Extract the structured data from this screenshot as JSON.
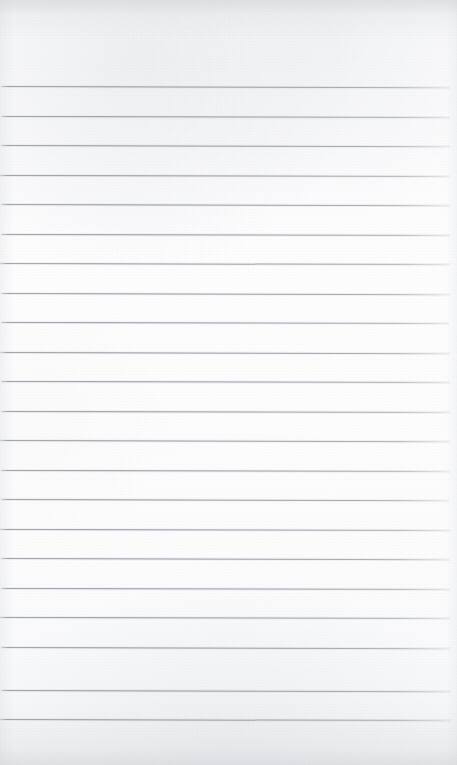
{
  "document": {
    "kind": "blank-ruled-notebook-paper",
    "title": "Blank Ruled Notebook Paper",
    "orientation": "portrait",
    "page_width_px": 457,
    "page_height_px": 765,
    "paper_color": "#fbfbfc",
    "paper_shadow_color": "#eef0f1",
    "has_text_content": false,
    "has_handwriting": false,
    "has_margin_rule": false,
    "body_text": ""
  },
  "ruling": {
    "style": "wide-ruled",
    "line_color": "#989ea7",
    "line_thickness_px": 1,
    "line_count": 22,
    "first_line_y": 86,
    "line_spacing_px": 29.45,
    "line_left_x": 1,
    "line_right_x": 450,
    "tilt_deg": 0.14,
    "top_margin_px": 86,
    "bottom_margin_px": 46,
    "lines": [
      {
        "index": 1,
        "y": 86,
        "left": 1,
        "width": 449,
        "tilt": 0.16
      },
      {
        "index": 2,
        "y": 116,
        "left": 1,
        "width": 449,
        "tilt": 0.14
      },
      {
        "index": 3,
        "y": 145,
        "left": 1,
        "width": 449,
        "tilt": 0.15
      },
      {
        "index": 4,
        "y": 175,
        "left": 0,
        "width": 450,
        "tilt": 0.13
      },
      {
        "index": 5,
        "y": 204,
        "left": 1,
        "width": 449,
        "tilt": 0.15
      },
      {
        "index": 6,
        "y": 234,
        "left": 1,
        "width": 449,
        "tilt": 0.12
      },
      {
        "index": 7,
        "y": 263,
        "left": 0,
        "width": 450,
        "tilt": 0.14
      },
      {
        "index": 8,
        "y": 293,
        "left": 1,
        "width": 449,
        "tilt": 0.16
      },
      {
        "index": 9,
        "y": 322,
        "left": 1,
        "width": 448,
        "tilt": 0.13
      },
      {
        "index": 10,
        "y": 352,
        "left": 0,
        "width": 450,
        "tilt": 0.15
      },
      {
        "index": 11,
        "y": 381,
        "left": 1,
        "width": 449,
        "tilt": 0.14
      },
      {
        "index": 12,
        "y": 411,
        "left": 1,
        "width": 449,
        "tilt": 0.12
      },
      {
        "index": 13,
        "y": 440,
        "left": 0,
        "width": 450,
        "tilt": 0.15
      },
      {
        "index": 14,
        "y": 470,
        "left": 1,
        "width": 449,
        "tilt": 0.14
      },
      {
        "index": 15,
        "y": 499,
        "left": 1,
        "width": 448,
        "tilt": 0.16
      },
      {
        "index": 16,
        "y": 529,
        "left": 0,
        "width": 450,
        "tilt": 0.13
      },
      {
        "index": 17,
        "y": 558,
        "left": 1,
        "width": 449,
        "tilt": 0.15
      },
      {
        "index": 18,
        "y": 588,
        "left": 1,
        "width": 449,
        "tilt": 0.14
      },
      {
        "index": 19,
        "y": 617,
        "left": 0,
        "width": 450,
        "tilt": 0.12
      },
      {
        "index": 20,
        "y": 647,
        "left": 1,
        "width": 449,
        "tilt": 0.16
      },
      {
        "index": 21,
        "y": 690,
        "left": 1,
        "width": 450,
        "tilt": 0.15
      },
      {
        "index": 22,
        "y": 719,
        "left": 0,
        "width": 451,
        "tilt": 0.14
      }
    ]
  }
}
